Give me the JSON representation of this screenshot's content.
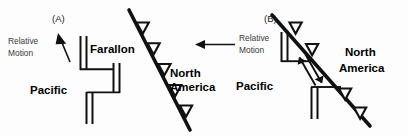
{
  "figure": {
    "width": 408,
    "height": 136,
    "background_color": "#fdfdfd",
    "line_color": "#111111",
    "text_color": "#000000",
    "annotation_color": "#3a3a3a"
  },
  "panels": [
    {
      "id": "A",
      "letter": "(A)",
      "plate_labels": [
        {
          "name": "pacific",
          "text": "Pacific"
        },
        {
          "name": "farallon",
          "text": "Farallon"
        },
        {
          "name": "north-america-line1",
          "text": "North"
        },
        {
          "name": "north-america-line2",
          "text": "America"
        }
      ],
      "annotations": [
        {
          "name": "relative-motion-left",
          "line1": "Relative",
          "line2": "Motion",
          "arrow_direction": "up-left"
        },
        {
          "name": "relative-motion-right",
          "line1": "Relative",
          "line2": "Motion",
          "arrow_direction": "left"
        }
      ],
      "features": {
        "subduction_zone": "diagonal trench with open triangles (teeth) on west side",
        "spreading_ridge": "offset double-line ridge segments with transform offsets",
        "teeth_count": 5
      }
    },
    {
      "id": "B",
      "letter": "(B)",
      "plate_labels": [
        {
          "name": "pacific",
          "text": "Pacific"
        },
        {
          "name": "north-america-line1",
          "text": "North"
        },
        {
          "name": "north-america-line2",
          "text": "America"
        }
      ],
      "annotations": [],
      "features": {
        "subduction_zone": "diagonal trench with open triangles, partially consumed",
        "spreading_ridge": "two remnant ridge segments intersecting the trench",
        "transform_fault": "strike-slip transform with paired half-arrows",
        "teeth_count": 4
      }
    }
  ]
}
